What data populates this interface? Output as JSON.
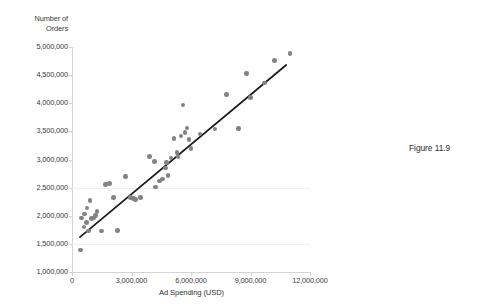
{
  "figure": {
    "caption": "Figure 11.9"
  },
  "chart_data": {
    "type": "scatter",
    "title": "",
    "xlabel": "Ad Spending (USD)",
    "ylabel": "Number of\nOrders",
    "ylabel_lines": [
      "Number of",
      "Orders"
    ],
    "xlim": [
      0,
      12000000
    ],
    "ylim": [
      1000000,
      5000000
    ],
    "xticks": [
      0,
      3000000,
      6000000,
      9000000,
      12000000
    ],
    "xtick_labels": [
      "0",
      "3,000,000",
      "6,000,000",
      "9,000,000",
      "12,000,000"
    ],
    "yticks": [
      1000000,
      1500000,
      2000000,
      2500000,
      3000000,
      3500000,
      4000000,
      4500000,
      5000000
    ],
    "ytick_labels": [
      "1,000,000",
      "1,500,000",
      "2,000,000",
      "2,500,000",
      "3,000,000",
      "3,500,000",
      "4,000,000",
      "4,500,000",
      "5,000,000"
    ],
    "grid": "horizontal-faint",
    "legend": "none",
    "marker_color": "#808285",
    "trendline_color": "#1a1a1a",
    "axis_color": "#d4d4d4",
    "points": [
      [
        420000,
        1390000
      ],
      [
        480000,
        1960000
      ],
      [
        600000,
        1800000
      ],
      [
        640000,
        2030000
      ],
      [
        720000,
        1880000
      ],
      [
        760000,
        2140000
      ],
      [
        820000,
        1730000
      ],
      [
        900000,
        2270000
      ],
      [
        980000,
        1950000
      ],
      [
        1080000,
        1960000
      ],
      [
        1180000,
        2000000
      ],
      [
        1260000,
        2080000
      ],
      [
        1480000,
        1730000
      ],
      [
        1700000,
        2560000
      ],
      [
        1900000,
        2570000
      ],
      [
        2100000,
        2320000
      ],
      [
        2300000,
        1740000
      ],
      [
        2700000,
        2700000
      ],
      [
        2950000,
        2320000
      ],
      [
        3100000,
        2310000
      ],
      [
        3200000,
        2290000
      ],
      [
        3450000,
        2320000
      ],
      [
        3900000,
        3050000
      ],
      [
        4150000,
        2960000
      ],
      [
        4200000,
        2510000
      ],
      [
        4400000,
        2620000
      ],
      [
        4550000,
        2650000
      ],
      [
        4700000,
        2850000
      ],
      [
        4750000,
        2950000
      ],
      [
        4850000,
        2720000
      ],
      [
        5000000,
        3030000
      ],
      [
        5150000,
        3370000
      ],
      [
        5300000,
        3120000
      ],
      [
        5350000,
        3050000
      ],
      [
        5500000,
        3420000
      ],
      [
        5600000,
        3970000
      ],
      [
        5700000,
        3480000
      ],
      [
        5800000,
        3560000
      ],
      [
        5900000,
        3360000
      ],
      [
        6000000,
        3200000
      ],
      [
        6450000,
        3450000
      ],
      [
        7200000,
        3540000
      ],
      [
        7800000,
        4160000
      ],
      [
        8400000,
        3550000
      ],
      [
        8800000,
        4530000
      ],
      [
        9000000,
        4100000
      ],
      [
        9700000,
        4360000
      ],
      [
        10200000,
        4760000
      ],
      [
        11000000,
        4880000
      ]
    ],
    "trendline": {
      "x_start": 400000,
      "y_start": 1620000,
      "x_end": 10800000,
      "y_end": 4680000
    }
  }
}
